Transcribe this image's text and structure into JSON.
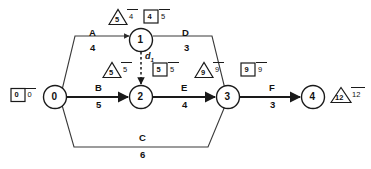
{
  "diagram": {
    "type": "activity-on-arrow-network",
    "title": "",
    "nodes": [
      {
        "id": "n0",
        "label": "0",
        "x": 55,
        "y": 97
      },
      {
        "id": "n1",
        "label": "1",
        "x": 141,
        "y": 40
      },
      {
        "id": "n2",
        "label": "2",
        "x": 141,
        "y": 97
      },
      {
        "id": "n3",
        "label": "3",
        "x": 228,
        "y": 97
      },
      {
        "id": "n4",
        "label": "4",
        "x": 313,
        "y": 97
      }
    ],
    "activities": [
      {
        "id": "A",
        "name": "A",
        "duration": "4",
        "from": "0",
        "to": "1",
        "name_x": 89,
        "name_y": 33,
        "dur_x": 91,
        "dur_y": 47
      },
      {
        "id": "B",
        "name": "B",
        "duration": "5",
        "from": "0",
        "to": "2",
        "name_x": 95,
        "name_y": 88,
        "dur_x": 96,
        "dur_y": 104
      },
      {
        "id": "C",
        "name": "C",
        "duration": "6",
        "from": "0",
        "to": "3",
        "name_x": 139,
        "name_y": 138,
        "dur_x": 140,
        "dur_y": 153
      },
      {
        "id": "D",
        "name": "D",
        "duration": "3",
        "from": "1",
        "to": "3",
        "name_x": 182,
        "name_y": 33,
        "dur_x": 184,
        "dur_y": 47
      },
      {
        "id": "E",
        "name": "E",
        "duration": "4",
        "from": "2",
        "to": "3",
        "name_x": 181,
        "name_y": 88,
        "dur_x": 182,
        "dur_y": 104
      },
      {
        "id": "F",
        "name": "F",
        "duration": "3",
        "from": "3",
        "to": "4",
        "name_x": 269,
        "name_y": 88,
        "dur_x": 270,
        "dur_y": 104
      }
    ],
    "dummy": {
      "id": "d1",
      "label": "d",
      "subscript": "1",
      "from": "1",
      "to": "2",
      "label_x": 145,
      "label_y": 56
    },
    "markers": [
      {
        "id": "m-node0",
        "shape": "box",
        "inner": "0",
        "outer": "0",
        "for_node": "0",
        "x": 10,
        "y": 88
      },
      {
        "id": "m-node1-triangle",
        "shape": "triangle",
        "inner": "5",
        "outer": "4",
        "for_node": "1",
        "x": 108,
        "y": 10
      },
      {
        "id": "m-node1-box",
        "shape": "box",
        "inner": "4",
        "outer": "5",
        "for_node": "1",
        "x": 143,
        "y": 9
      },
      {
        "id": "m-node2-triangle",
        "shape": "triangle",
        "inner": "5",
        "outer": "5",
        "for_node": "2",
        "x": 102,
        "y": 63
      },
      {
        "id": "m-node2-box",
        "shape": "box",
        "inner": "5",
        "outer": "5",
        "for_node": "2",
        "x": 152,
        "y": 62
      },
      {
        "id": "m-node3-triangle",
        "shape": "triangle",
        "inner": "9",
        "outer": "9",
        "for_node": "3",
        "x": 194,
        "y": 63
      },
      {
        "id": "m-node3-box",
        "shape": "box",
        "inner": "9",
        "outer": "9",
        "for_node": "3",
        "x": 240,
        "y": 62
      },
      {
        "id": "m-node4-triangle",
        "shape": "triangle",
        "inner": "12",
        "outer": "12",
        "for_node": "4",
        "x": 333,
        "y": 88
      }
    ],
    "colors": {
      "line": "#1a1a1a",
      "thin_line": "#555555",
      "text": "#111111",
      "background": "#ffffff"
    }
  }
}
